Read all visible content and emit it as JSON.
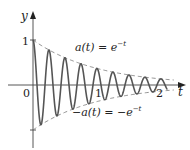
{
  "chart_data": {
    "type": "line",
    "title": "",
    "xlabel": "t",
    "ylabel": "y",
    "x_ticks": [
      {
        "value": 0,
        "label": "0"
      },
      {
        "value": 1,
        "label": "1"
      },
      {
        "value": 2,
        "label": "2"
      }
    ],
    "y_ticks": [
      {
        "value": 1,
        "label": "1"
      },
      {
        "value": -1,
        "label": ""
      }
    ],
    "xlim": [
      0,
      2.35
    ],
    "ylim": [
      -1.4,
      1.6
    ],
    "grid": false,
    "series": [
      {
        "name": "y = e^{-t} cos(8πt)",
        "style": "solid",
        "color": "#555555",
        "function": "exp(-t)*cos(8*pi*t)",
        "t_range": [
          0,
          2.1
        ],
        "omega": 25.1327
      },
      {
        "name": "a(t) = e^{-t}",
        "style": "dashed",
        "color": "#777777",
        "function": "exp(-t)",
        "t_range": [
          0,
          2.2
        ]
      },
      {
        "name": "-a(t) = -e^{-t}",
        "style": "dashed",
        "color": "#777777",
        "function": "-exp(-t)",
        "t_range": [
          0,
          2.2
        ]
      }
    ],
    "annotations": [
      {
        "text": "a(t) = e^{-t}",
        "near": "upper envelope"
      },
      {
        "text": "-a(t) = -e^{-t}",
        "near": "lower envelope"
      }
    ]
  },
  "labels": {
    "y_axis": "y",
    "t_axis": "t",
    "origin": "0",
    "y_one": "1",
    "t_one": "1",
    "t_two": "2",
    "upper_lhs": "a(t) = e",
    "upper_exp": "−t",
    "lower_lhs": "−a(t) = −e",
    "lower_exp": "−t"
  },
  "layout": {
    "origin_x": 33,
    "origin_y": 85,
    "x_scale": 64,
    "y_scale": 45
  }
}
